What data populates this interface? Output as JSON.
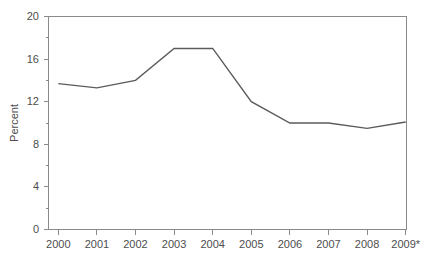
{
  "chart_data": {
    "type": "line",
    "title": "",
    "subtitle": "",
    "xlabel": "",
    "ylabel": "Percent",
    "x": [
      "2000",
      "2001",
      "2002",
      "2003",
      "2004",
      "2005",
      "2006",
      "2007",
      "2008",
      "2009*"
    ],
    "categories": [
      "2000",
      "2001",
      "2002",
      "2003",
      "2004",
      "2005",
      "2006",
      "2007",
      "2008",
      "2009*"
    ],
    "values": [
      13.7,
      13.3,
      14.0,
      17.0,
      17.0,
      12.0,
      10.0,
      10.0,
      9.5,
      10.1
    ],
    "series": [
      {
        "name": "Percent",
        "color": "#5b5b5b",
        "values": [
          13.7,
          13.3,
          14.0,
          17.0,
          17.0,
          12.0,
          10.0,
          10.0,
          9.5,
          10.1
        ]
      }
    ],
    "ylim": [
      0,
      20
    ],
    "y_major_ticks": [
      0,
      4,
      8,
      12,
      16,
      20
    ],
    "y_minor_ticks": [
      2,
      6,
      10,
      14,
      18
    ],
    "y_tick_labels": [
      "0",
      "4",
      "8",
      "12",
      "16",
      "20"
    ],
    "x_tick_labels": [
      "2000",
      "2001",
      "2002",
      "2003",
      "2004",
      "2005",
      "2006",
      "2007",
      "2008",
      "2009*"
    ],
    "grid": false,
    "legend": false,
    "legend_position": "none",
    "annotations": [
      "* denotes provisional or estimated value for 2009"
    ],
    "footnote_marker": "*",
    "line_color": "#5b5b5b",
    "axis_color": "#8a8a8a",
    "background_color": "#ffffff"
  },
  "axes": {
    "y_title": "Percent",
    "x_title": ""
  }
}
